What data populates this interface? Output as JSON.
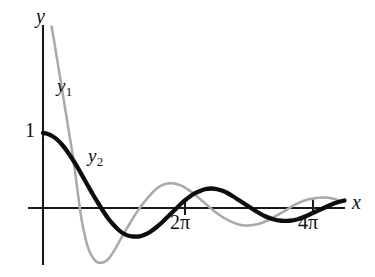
{
  "figure": {
    "background_color": "#ffffff",
    "axis_color": "#1a1a1a",
    "labels": {
      "y_axis": "y",
      "x_axis": "x",
      "curve_1_base": "y",
      "curve_1_sub": "1",
      "curve_2_base": "y",
      "curve_2_sub": "2",
      "y_tick_one": "1",
      "x_tick_2pi": "2π",
      "x_tick_4pi": "4π"
    }
  },
  "chart_data": {
    "type": "line",
    "title": "",
    "xlabel": "x",
    "ylabel": "y",
    "grid": false,
    "legend_position": "inline-annotation",
    "xlim": [
      -0.75,
      14.8
    ],
    "ylim": [
      -1.0,
      2.45
    ],
    "xticks": [
      6.283185,
      12.566371
    ],
    "xticklabels": [
      "2π",
      "4π"
    ],
    "yticks": [
      1
    ],
    "yticklabels": [
      "1"
    ],
    "annotations": [
      {
        "text": "y1",
        "x": 0.78,
        "y": 1.78,
        "series": "y1"
      },
      {
        "text": "y2",
        "x": 2.35,
        "y": 0.82,
        "series": "y2"
      }
    ],
    "series": [
      {
        "name": "y1",
        "label": "y₁",
        "color": "#a9a9a9",
        "style": "stippled",
        "linewidth": 2.6,
        "description": "Rapidly damped oscillation entering from top of frame, steep descent, first zero near x=1.7, deep first trough near x=3.0",
        "x": [
          0.42,
          0.55,
          0.7,
          0.85,
          1.0,
          1.15,
          1.3,
          1.45,
          1.6,
          1.72,
          1.85,
          2.0,
          2.2,
          2.4,
          2.6,
          2.8,
          3.0,
          3.2,
          3.4,
          3.6,
          3.8,
          4.0,
          4.25,
          4.5,
          4.75,
          5.0,
          5.25,
          5.5,
          5.75,
          6.0,
          6.28,
          6.55,
          6.85,
          7.15,
          7.45,
          7.75,
          8.05,
          8.35,
          8.65,
          9.0,
          9.4,
          9.8,
          10.2,
          10.6,
          11.0,
          11.4,
          11.8,
          12.2,
          12.57,
          12.95,
          13.35,
          13.75,
          14.15,
          14.55,
          14.8
        ],
        "y": [
          2.42,
          2.22,
          1.97,
          1.72,
          1.47,
          1.22,
          0.97,
          0.72,
          0.43,
          0.18,
          -0.08,
          -0.3,
          -0.52,
          -0.64,
          -0.71,
          -0.73,
          -0.72,
          -0.68,
          -0.61,
          -0.52,
          -0.42,
          -0.33,
          -0.21,
          -0.1,
          0.0,
          0.09,
          0.17,
          0.24,
          0.29,
          0.32,
          0.33,
          0.32,
          0.29,
          0.24,
          0.18,
          0.11,
          0.04,
          -0.03,
          -0.09,
          -0.15,
          -0.2,
          -0.23,
          -0.23,
          -0.21,
          -0.17,
          -0.11,
          -0.05,
          0.02,
          0.07,
          0.11,
          0.13,
          0.14,
          0.13,
          0.1,
          0.08
        ]
      },
      {
        "name": "y2",
        "label": "y₂",
        "color": "#0d0d0d",
        "style": "solid-thick",
        "linewidth": 4.3,
        "description": "Damped cosine starting at (0,1), first zero near x=3.0, first trough near x=4.5, crest just after 2pi",
        "x": [
          0.0,
          0.2,
          0.45,
          0.7,
          0.95,
          1.2,
          1.45,
          1.7,
          1.95,
          2.2,
          2.45,
          2.7,
          2.95,
          3.2,
          3.45,
          3.7,
          3.95,
          4.2,
          4.45,
          4.7,
          4.95,
          5.25,
          5.55,
          5.85,
          6.15,
          6.45,
          6.75,
          7.05,
          7.35,
          7.65,
          7.95,
          8.25,
          8.55,
          8.9,
          9.3,
          9.7,
          10.1,
          10.5,
          10.9,
          11.3,
          11.7,
          12.1,
          12.5,
          12.9,
          13.3,
          13.7,
          14.1,
          14.5,
          14.8
        ],
        "y": [
          1.0,
          0.99,
          0.96,
          0.91,
          0.84,
          0.75,
          0.65,
          0.54,
          0.42,
          0.3,
          0.18,
          0.07,
          -0.04,
          -0.14,
          -0.22,
          -0.29,
          -0.34,
          -0.37,
          -0.38,
          -0.38,
          -0.36,
          -0.32,
          -0.26,
          -0.19,
          -0.11,
          -0.03,
          0.05,
          0.12,
          0.18,
          0.22,
          0.25,
          0.26,
          0.25,
          0.22,
          0.16,
          0.09,
          0.02,
          -0.05,
          -0.11,
          -0.15,
          -0.17,
          -0.17,
          -0.15,
          -0.11,
          -0.06,
          -0.01,
          0.04,
          0.08,
          0.1
        ]
      }
    ]
  }
}
